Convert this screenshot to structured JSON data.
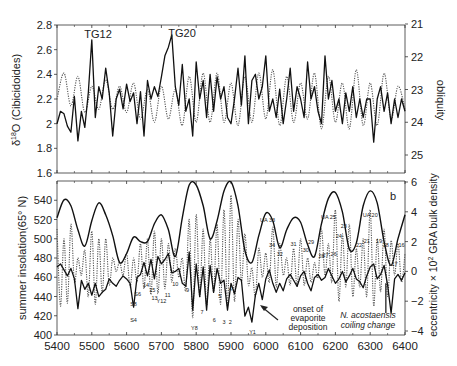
{
  "chart_data": [
    {
      "type": "line",
      "panel": "a",
      "title": "",
      "xlabel": "",
      "ylabel": "δ18O (Cibicidoides)",
      "ylabel_right": "obliquity",
      "xlim": [
        5400,
        6400
      ],
      "ylim": [
        1.6,
        2.8
      ],
      "ylim_right": [
        25,
        21
      ],
      "yticks": [
        "2.8",
        "2.6",
        "2.4",
        "2.2",
        "2",
        "1.8",
        "1.6"
      ],
      "yticks_right": [
        "21",
        "22",
        "23",
        "24",
        "25"
      ],
      "annotations": [
        {
          "text": "TG12",
          "x": 5500,
          "y": 2.72
        },
        {
          "text": "TG20",
          "x": 5750,
          "y": 2.72
        }
      ],
      "series": [
        {
          "name": "δ18O (Cibicidoides)",
          "style": "solid",
          "x": [
            5400,
            5410,
            5420,
            5430,
            5440,
            5450,
            5460,
            5470,
            5480,
            5490,
            5500,
            5510,
            5520,
            5530,
            5540,
            5550,
            5560,
            5570,
            5580,
            5590,
            5600,
            5610,
            5620,
            5630,
            5640,
            5650,
            5660,
            5670,
            5680,
            5690,
            5700,
            5710,
            5720,
            5730,
            5740,
            5750,
            5760,
            5770,
            5780,
            5790,
            5800,
            5810,
            5820,
            5830,
            5840,
            5850,
            5860,
            5870,
            5880,
            5890,
            5900,
            5910,
            5920,
            5930,
            5940,
            5950,
            5960,
            5970,
            5980,
            5990,
            6000,
            6010,
            6020,
            6030,
            6040,
            6050,
            6060,
            6070,
            6080,
            6090,
            6100,
            6110,
            6120,
            6130,
            6140,
            6150,
            6160,
            6170,
            6180,
            6190,
            6200,
            6210,
            6220,
            6230,
            6240,
            6250,
            6260,
            6270,
            6280,
            6290,
            6300,
            6310,
            6320,
            6330,
            6340,
            6350,
            6360,
            6370,
            6380,
            6390,
            6400
          ],
          "values": [
            2.0,
            2.1,
            2.08,
            1.98,
            1.93,
            2.22,
            1.86,
            2.1,
            1.97,
            2.25,
            2.68,
            2.05,
            2.3,
            2.2,
            2.45,
            2.25,
            1.9,
            2.2,
            2.28,
            2.12,
            2.32,
            2.18,
            2.25,
            2.0,
            2.26,
            1.9,
            2.35,
            2.2,
            2.3,
            2.22,
            2.38,
            2.55,
            2.62,
            2.72,
            2.3,
            2.15,
            2.48,
            2.1,
            2.2,
            1.9,
            2.5,
            2.2,
            2.35,
            2.05,
            2.4,
            2.1,
            2.38,
            2.2,
            2.3,
            2.05,
            2.0,
            2.2,
            2.45,
            2.15,
            2.55,
            2.0,
            2.35,
            2.4,
            2.2,
            2.3,
            2.55,
            2.1,
            2.2,
            2.05,
            2.28,
            2.0,
            2.2,
            2.45,
            2.1,
            2.3,
            2.2,
            2.05,
            2.5,
            2.2,
            2.3,
            2.1,
            2.0,
            2.55,
            2.2,
            2.35,
            2.1,
            2.2,
            2.0,
            2.25,
            2.1,
            2.3,
            2.05,
            2.2,
            2.05,
            2.2,
            2.2,
            1.85,
            2.2,
            2.3,
            2.1,
            2.25,
            2.0,
            2.2,
            2.05,
            2.2,
            2.1
          ]
        },
        {
          "name": "obliquity",
          "style": "dotted",
          "x": [
            5400,
            5420,
            5440,
            5460,
            5480,
            5500,
            5520,
            5540,
            5560,
            5580,
            5600,
            5620,
            5640,
            5660,
            5680,
            5700,
            5720,
            5740,
            5760,
            5780,
            5800,
            5820,
            5840,
            5860,
            5880,
            5900,
            5920,
            5940,
            5960,
            5980,
            6000,
            6020,
            6040,
            6060,
            6080,
            6100,
            6120,
            6140,
            6160,
            6180,
            6200,
            6220,
            6240,
            6260,
            6280,
            6300,
            6320,
            6340,
            6360,
            6380,
            6400
          ],
          "values": [
            23.3,
            22.5,
            23.5,
            22.6,
            23.7,
            22.9,
            23.6,
            22.7,
            23.6,
            22.9,
            23.7,
            22.8,
            23.9,
            23.0,
            24.0,
            22.9,
            23.9,
            23.0,
            24.1,
            22.6,
            24.0,
            22.5,
            24.0,
            22.5,
            24.0,
            22.8,
            24.1,
            22.6,
            24.0,
            22.5,
            23.9,
            22.4,
            24.1,
            22.6,
            24.0,
            22.8,
            23.9,
            22.5,
            24.2,
            22.6,
            24.0,
            22.8,
            24.2,
            22.4,
            24.1,
            22.8,
            24.1,
            22.5,
            23.9,
            22.9,
            23.6
          ]
        }
      ]
    },
    {
      "type": "line",
      "panel": "b",
      "title": "",
      "xlabel": "",
      "ylabel": "summer insolation(65° N)",
      "ylabel_right": "eccentricity × 10² GRA bulk density",
      "xlim": [
        5400,
        6400
      ],
      "ylim": [
        400,
        560
      ],
      "ylim_right": [
        -4,
        6
      ],
      "yticks": [
        "540",
        "520",
        "500",
        "480",
        "460",
        "440",
        "420",
        "400"
      ],
      "yticks_right": [
        "6",
        "4",
        "2",
        "0",
        "-2",
        "-4"
      ],
      "xticks": [
        "5400",
        "5500",
        "5600",
        "5700",
        "5800",
        "5900",
        "6000",
        "6100",
        "6200",
        "6300",
        "6400"
      ],
      "panel_label": "b",
      "annotations": [
        {
          "text": "onset of evaporite deposition",
          "x": 6080,
          "y": -2.8,
          "arrow_to": [
            5975,
            -1.5
          ]
        },
        {
          "text": "N. acostaensis coiling change",
          "x": 6300,
          "y": -3.5,
          "marker_x": 6345
        }
      ],
      "cycle_labels": [
        "S8",
        "S6",
        "S4",
        "15",
        "14",
        "13",
        "Y12",
        "11",
        "10",
        "9",
        "Y8",
        "7",
        "6",
        "5",
        "4",
        "3",
        "2",
        "Y1",
        "UA 33",
        "34",
        "32",
        "31",
        "30",
        "29",
        "28",
        "27",
        "26",
        "UA 25",
        "24",
        "23",
        "22",
        "21",
        "UA 20",
        "19",
        "18",
        "17",
        "16"
      ],
      "series": [
        {
          "name": "eccentricity",
          "style": "solid-thick",
          "x": [
            5400,
            5420,
            5440,
            5460,
            5480,
            5500,
            5520,
            5540,
            5560,
            5580,
            5600,
            5620,
            5640,
            5660,
            5680,
            5700,
            5720,
            5740,
            5760,
            5780,
            5800,
            5820,
            5840,
            5860,
            5880,
            5900,
            5920,
            5940,
            5960,
            5980,
            6000,
            6020,
            6040,
            6060,
            6080,
            6100,
            6120,
            6140,
            6160,
            6180,
            6200,
            6220,
            6240,
            6260,
            6280,
            6300,
            6320,
            6340,
            6360,
            6380,
            6400
          ],
          "values": [
            3.6,
            4.8,
            4.4,
            2.8,
            1.7,
            3.4,
            4.6,
            3.8,
            2.4,
            0.6,
            1.2,
            2.3,
            2.0,
            2.0,
            3.2,
            3.8,
            2.8,
            1.0,
            3.6,
            5.8,
            5.8,
            4.4,
            2.2,
            3.4,
            5.4,
            6.0,
            4.4,
            1.4,
            0.6,
            2.4,
            3.9,
            3.4,
            1.6,
            2.8,
            3.6,
            3.3,
            1.8,
            1.0,
            3.2,
            4.9,
            5.3,
            4.0,
            1.5,
            1.9,
            4.4,
            5.4,
            4.6,
            2.0,
            0.4,
            2.2,
            3.8
          ]
        },
        {
          "name": "summer insolation (65° N)",
          "style": "dotted",
          "x": [
            5400,
            5410,
            5420,
            5430,
            5440,
            5450,
            5460,
            5470,
            5480,
            5490,
            5500,
            5510,
            5520,
            5530,
            5540,
            5550,
            5560,
            5570,
            5580,
            5590,
            5600,
            5610,
            5620,
            5630,
            5640,
            5650,
            5660,
            5670,
            5680,
            5690,
            5700,
            5710,
            5720,
            5730,
            5740,
            5750,
            5760,
            5770,
            5780,
            5790,
            5800,
            5810,
            5820,
            5830,
            5840,
            5850,
            5860,
            5870,
            5880,
            5890,
            5900,
            5910,
            5920,
            5930,
            5940,
            5950,
            5960,
            5970,
            5980,
            5990,
            6000,
            6010,
            6020,
            6030,
            6040,
            6050,
            6060,
            6070,
            6080,
            6090,
            6100,
            6110,
            6120,
            6130,
            6140,
            6150,
            6160,
            6170,
            6180,
            6190,
            6200,
            6210,
            6220,
            6230,
            6240,
            6250,
            6260,
            6270,
            6280,
            6290,
            6300,
            6310,
            6320,
            6330,
            6340,
            6350,
            6360,
            6370,
            6380,
            6390,
            6400
          ],
          "values": [
            510,
            430,
            500,
            433,
            515,
            455,
            480,
            462,
            488,
            440,
            508,
            432,
            500,
            444,
            500,
            452,
            480,
            466,
            476,
            462,
            485,
            450,
            480,
            455,
            495,
            448,
            500,
            442,
            508,
            443,
            500,
            448,
            495,
            455,
            490,
            460,
            480,
            446,
            520,
            418,
            525,
            440,
            510,
            430,
            500,
            445,
            515,
            432,
            530,
            430,
            545,
            435,
            520,
            455,
            505,
            452,
            470,
            440,
            490,
            460,
            485,
            455,
            512,
            450,
            495,
            462,
            480,
            452,
            490,
            450,
            500,
            452,
            480,
            455,
            475,
            460,
            510,
            462,
            495,
            455,
            530,
            435,
            505,
            450,
            515,
            440,
            490,
            450,
            500,
            440,
            530,
            430,
            500,
            445,
            510,
            440,
            498,
            462,
            495,
            455,
            485
          ]
        },
        {
          "name": "GRA bulk density",
          "style": "solid",
          "x": [
            5400,
            5410,
            5420,
            5430,
            5440,
            5450,
            5460,
            5470,
            5480,
            5490,
            5500,
            5510,
            5520,
            5530,
            5540,
            5550,
            5560,
            5570,
            5580,
            5590,
            5600,
            5610,
            5620,
            5630,
            5640,
            5650,
            5660,
            5670,
            5680,
            5690,
            5700,
            5710,
            5720,
            5730,
            5740,
            5750,
            5760,
            5770,
            5780,
            5790,
            5800,
            5810,
            5820,
            5830,
            5840,
            5850,
            5860,
            5870,
            5880,
            5890,
            5900,
            5910,
            5920,
            5930,
            5940,
            5950,
            5960,
            5970,
            5980,
            5990,
            6000,
            6010,
            6020,
            6030,
            6040,
            6050,
            6060,
            6070,
            6080,
            6090,
            6100,
            6110,
            6120,
            6130,
            6140,
            6150,
            6160,
            6170,
            6180,
            6190,
            6200,
            6210,
            6220,
            6230,
            6240,
            6250,
            6260,
            6270,
            6280,
            6290,
            6300,
            6310,
            6320,
            6330,
            6340,
            6350,
            6360,
            6370,
            6380,
            6390,
            6400
          ],
          "values": [
            0.3,
            0.5,
            0.1,
            -0.3,
            0.2,
            -0.5,
            -2.5,
            -0.6,
            -1.2,
            -0.8,
            -1.6,
            -0.8,
            -1.7,
            -1.4,
            -1.2,
            -0.5,
            -0.8,
            -1.0,
            -0.6,
            -0.3,
            -0.5,
            -0.8,
            -2.4,
            -0.4,
            -0.2,
            0.6,
            -0.3,
            0.8,
            -0.5,
            1.0,
            0.5,
            0.8,
            1.2,
            -0.1,
            0.0,
            0.2,
            -0.8,
            -1.0,
            1.3,
            -2.6,
            0.5,
            -1.7,
            0.3,
            -2.6,
            0.4,
            -1.4,
            0.2,
            -0.8,
            -0.6,
            -2.6,
            -0.8,
            -1.5,
            -0.4,
            -0.6,
            -3.0,
            -2.4,
            -3.4,
            -1.6,
            -0.8,
            -1.9,
            -0.5,
            0.1,
            -0.8,
            -1.4,
            -0.8,
            -1.3,
            -0.5,
            -0.2,
            -0.6,
            -1.0,
            -0.3,
            0.0,
            -0.8,
            -1.3,
            -0.4,
            -0.2,
            -0.6,
            -0.4,
            0.2,
            -0.3,
            -0.8,
            -0.5,
            0.0,
            -0.7,
            -0.3,
            0.2,
            -0.5,
            -0.7,
            -1.1,
            -0.3,
            0.3,
            0.5,
            -0.5,
            -0.2,
            0.4,
            -0.9,
            -2.8,
            -0.5,
            -0.2,
            -0.6,
            -0.1
          ]
        }
      ]
    }
  ]
}
